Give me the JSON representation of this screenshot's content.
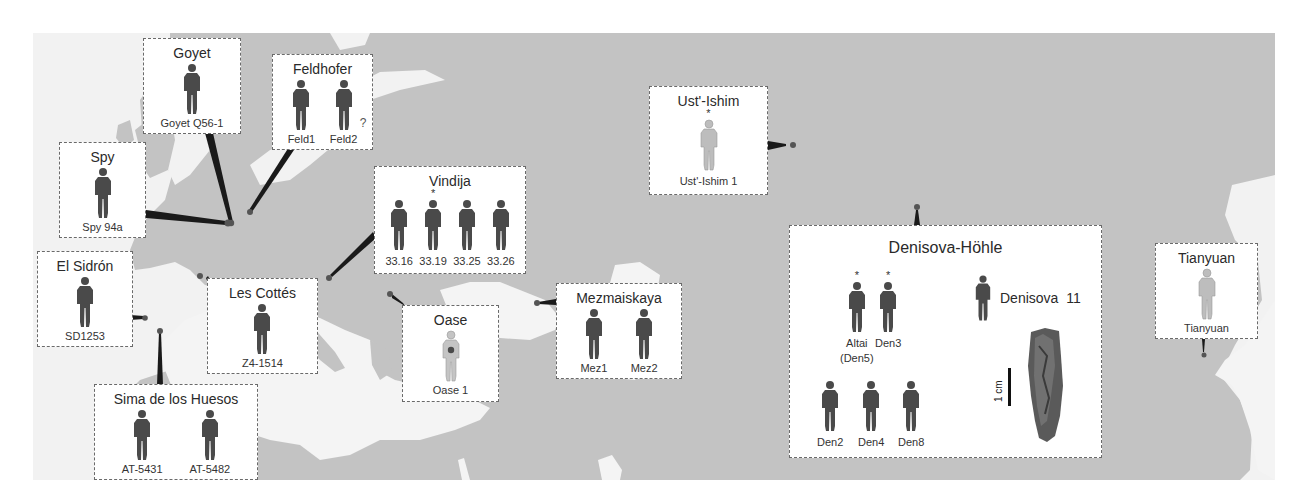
{
  "figure": {
    "type": "map-with-site-callouts",
    "region": "Eurasia",
    "colors": {
      "land": "#c2c2c2",
      "water": "#f3f3f3",
      "figure_dark": "#4a4a4a",
      "figure_light": "#bdbdbd",
      "connector": "#1a1a1a",
      "site_dot": "#555555"
    }
  },
  "sites": [
    {
      "id": "goyet",
      "title": "Goyet",
      "individuals": [
        {
          "label": "Goyet Q56-1",
          "tone": "dark"
        }
      ]
    },
    {
      "id": "feldhofer",
      "title": "Feldhofer",
      "individuals": [
        {
          "label": "Feld1",
          "tone": "dark"
        },
        {
          "label": "Feld2",
          "tone": "dark",
          "note": "?"
        }
      ]
    },
    {
      "id": "spy",
      "title": "Spy",
      "individuals": [
        {
          "label": "Spy 94a",
          "tone": "dark"
        }
      ]
    },
    {
      "id": "el-sidron",
      "title": "El Sidrón",
      "individuals": [
        {
          "label": "SD1253",
          "tone": "dark"
        }
      ]
    },
    {
      "id": "les-cottes",
      "title": "Les Cottés",
      "individuals": [
        {
          "label": "Z4-1514",
          "tone": "dark"
        }
      ]
    },
    {
      "id": "sima",
      "title": "Sima de los Huesos",
      "individuals": [
        {
          "label": "AT-5431",
          "tone": "dark"
        },
        {
          "label": "AT-5482",
          "tone": "dark"
        }
      ]
    },
    {
      "id": "vindija",
      "title": "Vindija",
      "individuals": [
        {
          "label": "33.16",
          "tone": "dark"
        },
        {
          "label": "33.19",
          "tone": "dark",
          "star": "*"
        },
        {
          "label": "33.25",
          "tone": "dark"
        },
        {
          "label": "33.26",
          "tone": "dark"
        }
      ]
    },
    {
      "id": "oase",
      "title": "Oase",
      "individuals": [
        {
          "label": "Oase 1",
          "tone": "light-spot"
        }
      ]
    },
    {
      "id": "mezmaiskaya",
      "title": "Mezmaiskaya",
      "individuals": [
        {
          "label": "Mez1",
          "tone": "dark"
        },
        {
          "label": "Mez2",
          "tone": "dark"
        }
      ]
    },
    {
      "id": "ust-ishim",
      "title": "Ust'-Ishim",
      "individuals": [
        {
          "label": "Ust'-Ishim 1",
          "tone": "light",
          "star": "*"
        }
      ]
    },
    {
      "id": "denisova",
      "title": "Denisova-Höhle",
      "individuals": [
        {
          "label": "Altai",
          "label2": "(Den5)",
          "tone": "dark",
          "star": "*"
        },
        {
          "label": "Den3",
          "tone": "dark",
          "star": "*"
        },
        {
          "label": "Den2",
          "tone": "dark"
        },
        {
          "label": "Den4",
          "tone": "dark"
        },
        {
          "label": "Den8",
          "tone": "dark"
        },
        {
          "label": "Denisova  11",
          "tone": "dark"
        }
      ],
      "scale_bar": "1 cm"
    },
    {
      "id": "tianyuan",
      "title": "Tianyuan",
      "individuals": [
        {
          "label": "Tianyuan",
          "tone": "light"
        }
      ]
    }
  ]
}
